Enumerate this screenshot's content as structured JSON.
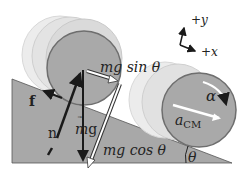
{
  "diagram": {
    "axes": {
      "y_label": "+y",
      "x_label": "+x"
    },
    "forces": {
      "friction": "f",
      "normal": "n",
      "gravity_prefix": "m",
      "gravity_vec": "g",
      "parallel_component": "mg sin θ",
      "perpendicular_component": "mg cos θ"
    },
    "labels": {
      "angular_acceleration": "α",
      "linear_acceleration_main": "a",
      "linear_acceleration_sub": "CM",
      "incline_angle": "θ"
    },
    "colors": {
      "incline_fill": "#a8a8a8",
      "cylinder_face": "#a9a9a9",
      "cylinder_ghost": "#e2e2e2",
      "rim": "#6e6e6e",
      "arrow": "#1a1a1a",
      "hollow_arrow": "#ffffff"
    }
  }
}
